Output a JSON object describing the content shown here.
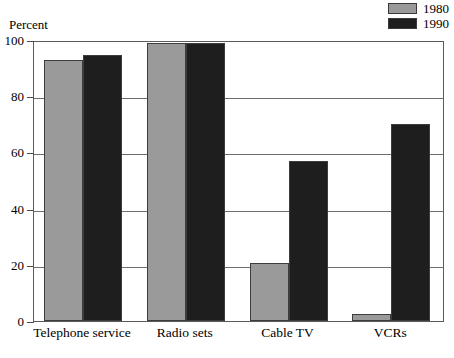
{
  "axis_title": "Percent",
  "legend": {
    "position": "top-right",
    "entries": [
      {
        "label": "1980",
        "color": "#9a9a9a",
        "swatch_name": "legend-swatch-1980"
      },
      {
        "label": "1990",
        "color": "#1e1e1e",
        "swatch_name": "legend-swatch-1990"
      }
    ]
  },
  "yticks": [
    {
      "label": "100",
      "value": 100
    },
    {
      "label": "80",
      "value": 80
    },
    {
      "label": "60",
      "value": 60
    },
    {
      "label": "40",
      "value": 40
    },
    {
      "label": "20",
      "value": 20
    },
    {
      "label": "0",
      "value": 0
    }
  ],
  "chart_data": {
    "type": "bar",
    "title": "",
    "subtitle": "",
    "xlabel": "",
    "ylabel": "Percent",
    "ylim": [
      0,
      100
    ],
    "grid": true,
    "legend_position": "top-right",
    "categories": [
      "Telephone service",
      "Radio sets",
      "Cable TV",
      "VCRs"
    ],
    "series": [
      {
        "name": "1980",
        "color": "#9a9a9a",
        "values": [
          93,
          99,
          20.5,
          2.5
        ]
      },
      {
        "name": "1990",
        "color": "#1e1e1e",
        "values": [
          94.5,
          99,
          57,
          70
        ]
      }
    ]
  }
}
